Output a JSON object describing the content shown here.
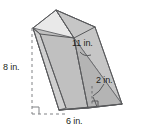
{
  "figure": {
    "name": "triangular-prism-diagram",
    "shape": "triangular prism",
    "background_color": "#ffffff",
    "stroke_color": "#58595b",
    "dashed_color": "#808285",
    "face_colors": {
      "top_left": "#e6e6e6",
      "top_right": "#d6d6d6",
      "front_left": "#c9c9c9",
      "front_right": "#b8b8b8",
      "base_triangle": "#a9a9a9"
    },
    "labels": {
      "length": "11 in.",
      "height": "8 in.",
      "altitude": "2 in.",
      "base": "6 in."
    },
    "measurements": [
      {
        "id": "length",
        "value": 11,
        "unit": "in.",
        "text": "11 in.",
        "describes": "prism lateral edge length"
      },
      {
        "id": "height",
        "value": 8,
        "unit": "in.",
        "text": "8 in.",
        "describes": "vertical height from base to top vertex"
      },
      {
        "id": "altitude",
        "value": 2,
        "unit": "in.",
        "text": "2 in.",
        "describes": "altitude of triangular base"
      },
      {
        "id": "base",
        "value": 6,
        "unit": "in.",
        "text": "6 in.",
        "describes": "base edge of triangular face"
      }
    ],
    "markers": [
      {
        "id": "right-angle-bottom-left",
        "type": "right angle square"
      },
      {
        "id": "right-angle-altitude",
        "type": "right angle square"
      }
    ]
  }
}
